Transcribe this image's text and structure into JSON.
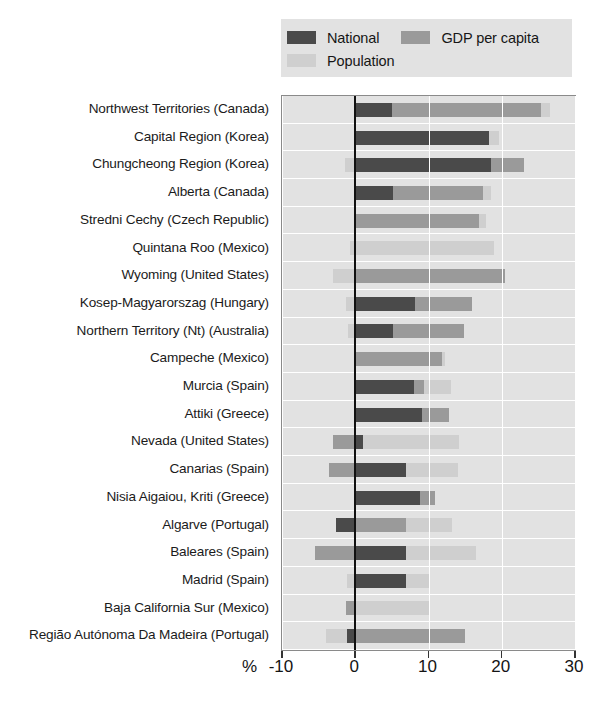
{
  "chart_data": {
    "type": "bar",
    "orientation": "horizontal",
    "stacked": true,
    "title": "",
    "xlabel": "%",
    "ylabel": "",
    "xlim": [
      -10,
      30
    ],
    "xticks": [
      -10,
      0,
      10,
      20,
      30
    ],
    "xtick_labels": [
      "-10",
      "0",
      "10",
      "20",
      "30"
    ],
    "grid": true,
    "legend_position": "top",
    "colors": {
      "national": "#4a4a4a",
      "gdp_per_capita": "#9a9a9a",
      "population": "#cfcfcf",
      "plot_background": "#e2e2e2",
      "legend_background": "#e2e2e2",
      "gridline": "#ffffff",
      "zero_line": "#111111",
      "axis_border": "#8a8a8a"
    },
    "series": [
      {
        "name": "National",
        "key": "national",
        "color": "#4a4a4a"
      },
      {
        "name": "GDP per capita",
        "key": "gdp_per_capita",
        "color": "#9a9a9a"
      },
      {
        "name": "Population",
        "key": "population",
        "color": "#cfcfcf"
      }
    ],
    "categories": [
      "Northwest Territories (Canada)",
      "Capital Region (Korea)",
      "Chungcheong Region (Korea)",
      "Alberta (Canada)",
      "Stredni Cechy (Czech Republic)",
      "Quintana Roo (Mexico)",
      "Wyoming (United States)",
      "Kosep-Magyarorszag (Hungary)",
      "Northern Territory (Nt) (Australia)",
      "Campeche (Mexico)",
      "Murcia (Spain)",
      "Attiki (Greece)",
      "Nevada (United States)",
      "Canarias  (Spain)",
      "Nisia Aigaiou, Kriti (Greece)",
      "Algarve (Portugal)",
      "Baleares (Spain)",
      "Madrid (Spain)",
      "Baja California Sur (Mexico)",
      "Região Autónoma Da Madeira (Portugal)"
    ],
    "rows": [
      {
        "category": "Northwest Territories (Canada)",
        "segments": [
          {
            "series": "National",
            "start": 0.0,
            "end": 5.0
          },
          {
            "series": "GDP per capita",
            "start": 5.0,
            "end": 25.4
          },
          {
            "series": "Population",
            "start": 25.4,
            "end": 26.6
          }
        ]
      },
      {
        "category": "Capital Region (Korea)",
        "segments": [
          {
            "series": "National",
            "start": 0.0,
            "end": 18.2
          },
          {
            "series": "Population",
            "start": 18.2,
            "end": 19.6
          }
        ]
      },
      {
        "category": "Chungcheong Region (Korea)",
        "segments": [
          {
            "series": "Population",
            "start": -1.4,
            "end": 0.0
          },
          {
            "series": "National",
            "start": 0.0,
            "end": 18.6
          },
          {
            "series": "GDP per capita",
            "start": 18.6,
            "end": 23.0
          }
        ]
      },
      {
        "category": "Alberta (Canada)",
        "segments": [
          {
            "series": "National",
            "start": 0.0,
            "end": 5.1
          },
          {
            "series": "GDP per capita",
            "start": 5.1,
            "end": 17.4
          },
          {
            "series": "Population",
            "start": 17.4,
            "end": 18.6
          }
        ]
      },
      {
        "category": "Stredni Cechy (Czech Republic)",
        "segments": [
          {
            "series": "GDP per capita",
            "start": 0.0,
            "end": 16.9
          },
          {
            "series": "Population",
            "start": 16.9,
            "end": 17.8
          }
        ]
      },
      {
        "category": "Quintana Roo (Mexico)",
        "segments": [
          {
            "series": "Population",
            "start": -0.7,
            "end": 19.0
          }
        ]
      },
      {
        "category": "Wyoming (United States)",
        "segments": [
          {
            "series": "Population",
            "start": -3.1,
            "end": 0.0
          },
          {
            "series": "GDP per capita",
            "start": 0.0,
            "end": 20.5
          }
        ]
      },
      {
        "category": "Kosep-Magyarorszag (Hungary)",
        "segments": [
          {
            "series": "Population",
            "start": -1.2,
            "end": 0.0
          },
          {
            "series": "National",
            "start": 0.0,
            "end": 8.2
          },
          {
            "series": "GDP per capita",
            "start": 8.2,
            "end": 16.0
          }
        ]
      },
      {
        "category": "Northern Territory (Nt) (Australia)",
        "segments": [
          {
            "series": "Population",
            "start": -1.0,
            "end": 0.0
          },
          {
            "series": "National",
            "start": 0.0,
            "end": 5.1
          },
          {
            "series": "GDP per capita",
            "start": 5.1,
            "end": 14.9
          }
        ]
      },
      {
        "category": "Campeche (Mexico)",
        "segments": [
          {
            "series": "GDP per capita",
            "start": 0.0,
            "end": 11.8
          },
          {
            "series": "Population",
            "start": 11.8,
            "end": 12.2
          }
        ]
      },
      {
        "category": "Murcia (Spain)",
        "segments": [
          {
            "series": "National",
            "start": 0.0,
            "end": 8.0
          },
          {
            "series": "GDP per capita",
            "start": 8.0,
            "end": 9.4
          },
          {
            "series": "Population",
            "start": 9.4,
            "end": 13.1
          }
        ]
      },
      {
        "category": "Attiki (Greece)",
        "segments": [
          {
            "series": "National",
            "start": 0.0,
            "end": 9.1
          },
          {
            "series": "GDP per capita",
            "start": 9.1,
            "end": 12.8
          }
        ]
      },
      {
        "category": "Nevada (United States)",
        "segments": [
          {
            "series": "GDP per capita",
            "start": -3.1,
            "end": 0.0
          },
          {
            "series": "National",
            "start": 0.0,
            "end": 1.0
          },
          {
            "series": "Population",
            "start": 1.0,
            "end": 14.1
          }
        ]
      },
      {
        "category": "Canarias  (Spain)",
        "segments": [
          {
            "series": "GDP per capita",
            "start": -3.6,
            "end": 0.0
          },
          {
            "series": "National",
            "start": 0.0,
            "end": 6.9
          },
          {
            "series": "Population",
            "start": 6.9,
            "end": 14.0
          }
        ]
      },
      {
        "category": "Nisia Aigaiou, Kriti (Greece)",
        "segments": [
          {
            "series": "National",
            "start": 0.0,
            "end": 8.8
          },
          {
            "series": "GDP per capita",
            "start": 8.8,
            "end": 10.9
          }
        ]
      },
      {
        "category": "Algarve (Portugal)",
        "segments": [
          {
            "series": "National",
            "start": -2.6,
            "end": 0.0
          },
          {
            "series": "GDP per capita",
            "start": 0.0,
            "end": 6.9
          },
          {
            "series": "Population",
            "start": 6.9,
            "end": 13.2
          }
        ]
      },
      {
        "category": "Baleares (Spain)",
        "segments": [
          {
            "series": "GDP per capita",
            "start": -5.5,
            "end": 0.0
          },
          {
            "series": "National",
            "start": 0.0,
            "end": 6.9
          },
          {
            "series": "Population",
            "start": 6.9,
            "end": 16.5
          }
        ]
      },
      {
        "category": "Madrid (Spain)",
        "segments": [
          {
            "series": "Population",
            "start": -1.1,
            "end": 0.0
          },
          {
            "series": "National",
            "start": 0.0,
            "end": 6.9
          },
          {
            "series": "Population",
            "start": 6.9,
            "end": 10.2
          }
        ]
      },
      {
        "category": "Baja California Sur (Mexico)",
        "segments": [
          {
            "series": "GDP per capita",
            "start": -1.2,
            "end": 0.0
          },
          {
            "series": "Population",
            "start": 0.0,
            "end": 10.1
          }
        ]
      },
      {
        "category": "Região Autónoma Da Madeira (Portugal)",
        "segments": [
          {
            "series": "Population",
            "start": -4.0,
            "end": -1.1
          },
          {
            "series": "National",
            "start": -1.1,
            "end": 0.0
          },
          {
            "series": "GDP per capita",
            "start": 0.0,
            "end": 15.0
          }
        ]
      }
    ]
  },
  "legend": {
    "items": [
      {
        "label": "National",
        "color": "#4a4a4a"
      },
      {
        "label": "GDP per capita",
        "color": "#9a9a9a"
      },
      {
        "label": "Population",
        "color": "#cfcfcf"
      }
    ]
  },
  "axis": {
    "unit_label": "%",
    "tick_labels": [
      "-10",
      "0",
      "10",
      "20",
      "30"
    ]
  }
}
